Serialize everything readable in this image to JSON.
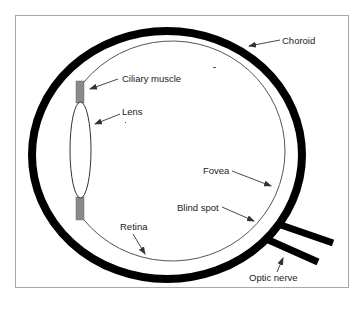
{
  "diagram": {
    "colors": {
      "background": "#ffffff",
      "frame": "#a8a8a8",
      "choroid": "#000000",
      "retina": "#555555",
      "ciliary_muscle": "#8a8a8a",
      "lens_fill": "#ffffff",
      "lens_stroke": "#333333",
      "optic_nerve": "#000000",
      "label_text": "#222222",
      "leader_line": "#333333"
    },
    "labels": {
      "choroid": "Choroid",
      "ciliary_muscle": "Ciliary muscle",
      "lens": "Lens",
      "fovea": "Fovea",
      "blind_spot": "Blind spot",
      "retina": "Retina",
      "optic_nerve": "Optic nerve"
    }
  }
}
